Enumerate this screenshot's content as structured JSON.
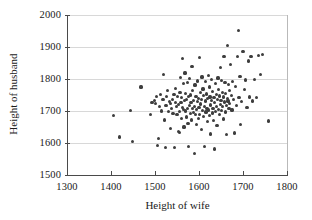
{
  "chart_data": {
    "type": "scatter",
    "title": "",
    "xlabel": "Height of wife",
    "ylabel": "Height of husband",
    "xlim": [
      1300,
      1800
    ],
    "ylim": [
      1500,
      2000
    ],
    "xticks": [
      1300,
      1400,
      1500,
      1600,
      1700,
      1800
    ],
    "yticks": [
      1500,
      1600,
      1700,
      1800,
      1900,
      2000
    ],
    "xticklabels": [
      "1300",
      "1400",
      "1500",
      "1600",
      "1700",
      "1800"
    ],
    "yticklabels": [
      "1500",
      "1600",
      "1700",
      "1800",
      "1900",
      "2000"
    ],
    "grid": "horizontal",
    "legend": null,
    "marker": "circle",
    "marker_color": "#3d3d3d",
    "points": [
      [
        1406,
        1686
      ],
      [
        1420,
        1619
      ],
      [
        1445,
        1701
      ],
      [
        1449,
        1605
      ],
      [
        1468,
        1775
      ],
      [
        1489,
        1690
      ],
      [
        1493,
        1726
      ],
      [
        1498,
        1732
      ],
      [
        1501,
        1723
      ],
      [
        1503,
        1746
      ],
      [
        1505,
        1591
      ],
      [
        1508,
        1614
      ],
      [
        1510,
        1713
      ],
      [
        1512,
        1752
      ],
      [
        1515,
        1700
      ],
      [
        1518,
        1735
      ],
      [
        1520,
        1813
      ],
      [
        1521,
        1672
      ],
      [
        1523,
        1586
      ],
      [
        1525,
        1718
      ],
      [
        1527,
        1746
      ],
      [
        1529,
        1765
      ],
      [
        1531,
        1699
      ],
      [
        1533,
        1729
      ],
      [
        1535,
        1724
      ],
      [
        1536,
        1646
      ],
      [
        1538,
        1708
      ],
      [
        1540,
        1736
      ],
      [
        1541,
        1693
      ],
      [
        1543,
        1751
      ],
      [
        1544,
        1587
      ],
      [
        1546,
        1726
      ],
      [
        1547,
        1770
      ],
      [
        1549,
        1713
      ],
      [
        1550,
        1689
      ],
      [
        1551,
        1745
      ],
      [
        1553,
        1636
      ],
      [
        1554,
        1720
      ],
      [
        1555,
        1632
      ],
      [
        1556,
        1698
      ],
      [
        1557,
        1759
      ],
      [
        1558,
        1804
      ],
      [
        1559,
        1727
      ],
      [
        1560,
        1676
      ],
      [
        1561,
        1742
      ],
      [
        1562,
        1864
      ],
      [
        1563,
        1712
      ],
      [
        1564,
        1786
      ],
      [
        1565,
        1704
      ],
      [
        1566,
        1650
      ],
      [
        1567,
        1732
      ],
      [
        1568,
        1819
      ],
      [
        1569,
        1700
      ],
      [
        1570,
        1755
      ],
      [
        1571,
        1681
      ],
      [
        1572,
        1737
      ],
      [
        1573,
        1789
      ],
      [
        1574,
        1708
      ],
      [
        1575,
        1662
      ],
      [
        1576,
        1745
      ],
      [
        1577,
        1588
      ],
      [
        1578,
        1717
      ],
      [
        1579,
        1802
      ],
      [
        1580,
        1693
      ],
      [
        1581,
        1750
      ],
      [
        1582,
        1727
      ],
      [
        1583,
        1672
      ],
      [
        1584,
        1840
      ],
      [
        1585,
        1709
      ],
      [
        1586,
        1763
      ],
      [
        1587,
        1696
      ],
      [
        1588,
        1733
      ],
      [
        1589,
        1567
      ],
      [
        1590,
        1714
      ],
      [
        1591,
        1781
      ],
      [
        1592,
        1688
      ],
      [
        1593,
        1746
      ],
      [
        1594,
        1705
      ],
      [
        1595,
        1659
      ],
      [
        1596,
        1729
      ],
      [
        1597,
        1794
      ],
      [
        1598,
        1677
      ],
      [
        1599,
        1740
      ],
      [
        1600,
        1712
      ],
      [
        1601,
        1868
      ],
      [
        1602,
        1690
      ],
      [
        1603,
        1757
      ],
      [
        1604,
        1722
      ],
      [
        1605,
        1641
      ],
      [
        1606,
        1736
      ],
      [
        1607,
        1806
      ],
      [
        1608,
        1701
      ],
      [
        1609,
        1769
      ],
      [
        1610,
        1684
      ],
      [
        1611,
        1748
      ],
      [
        1612,
        1715
      ],
      [
        1613,
        1589
      ],
      [
        1614,
        1731
      ],
      [
        1615,
        1792
      ],
      [
        1616,
        1697
      ],
      [
        1617,
        1753
      ],
      [
        1618,
        1709
      ],
      [
        1619,
        1666
      ],
      [
        1620,
        1738
      ],
      [
        1621,
        1812
      ],
      [
        1622,
        1703
      ],
      [
        1623,
        1775
      ],
      [
        1624,
        1686
      ],
      [
        1625,
        1744
      ],
      [
        1626,
        1719
      ],
      [
        1627,
        1628
      ],
      [
        1628,
        1734
      ],
      [
        1629,
        1799
      ],
      [
        1630,
        1694
      ],
      [
        1631,
        1761
      ],
      [
        1632,
        1707
      ],
      [
        1633,
        1671
      ],
      [
        1634,
        1742
      ],
      [
        1635,
        1581
      ],
      [
        1636,
        1726
      ],
      [
        1637,
        1785
      ],
      [
        1638,
        1699
      ],
      [
        1639,
        1751
      ],
      [
        1640,
        1713
      ],
      [
        1641,
        1655
      ],
      [
        1642,
        1737
      ],
      [
        1643,
        1803
      ],
      [
        1644,
        1705
      ],
      [
        1645,
        1768
      ],
      [
        1646,
        1690
      ],
      [
        1647,
        1747
      ],
      [
        1648,
        1721
      ],
      [
        1649,
        1836
      ],
      [
        1650,
        1733
      ],
      [
        1651,
        1796
      ],
      [
        1652,
        1702
      ],
      [
        1653,
        1759
      ],
      [
        1654,
        1715
      ],
      [
        1655,
        1675
      ],
      [
        1656,
        1744
      ],
      [
        1657,
        1870
      ],
      [
        1658,
        1728
      ],
      [
        1659,
        1790
      ],
      [
        1660,
        1697
      ],
      [
        1661,
        1755
      ],
      [
        1662,
        1718
      ],
      [
        1663,
        1626
      ],
      [
        1664,
        1740
      ],
      [
        1665,
        1905
      ],
      [
        1666,
        1731
      ],
      [
        1667,
        1782
      ],
      [
        1668,
        1708
      ],
      [
        1669,
        1763
      ],
      [
        1670,
        1723
      ],
      [
        1671,
        1845
      ],
      [
        1673,
        1749
      ],
      [
        1675,
        1703
      ],
      [
        1677,
        1793
      ],
      [
        1679,
        1735
      ],
      [
        1681,
        1631
      ],
      [
        1683,
        1776
      ],
      [
        1685,
        1717
      ],
      [
        1687,
        1871
      ],
      [
        1689,
        1951
      ],
      [
        1691,
        1742
      ],
      [
        1693,
        1809
      ],
      [
        1695,
        1659
      ],
      [
        1697,
        1729
      ],
      [
        1700,
        1886
      ],
      [
        1703,
        1766
      ],
      [
        1706,
        1797
      ],
      [
        1709,
        1712
      ],
      [
        1712,
        1856
      ],
      [
        1715,
        1744
      ],
      [
        1718,
        1871
      ],
      [
        1722,
        1731
      ],
      [
        1726,
        1798
      ],
      [
        1730,
        1741
      ],
      [
        1735,
        1873
      ],
      [
        1740,
        1815
      ],
      [
        1745,
        1876
      ],
      [
        1758,
        1669
      ]
    ]
  }
}
